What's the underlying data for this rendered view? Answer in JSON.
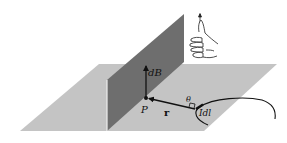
{
  "diagram": {
    "type": "biot-savart-geometry",
    "labels": {
      "field_element": "dB",
      "field_point": "P",
      "position_vector": "r",
      "angle": "θ",
      "current_element": "Idl"
    },
    "colors": {
      "horizontal_plane": "#c4c4c4",
      "vertical_plane": "#6e6e6e",
      "vertical_plane_edge": "#f0f0f0",
      "ink": "#111111"
    },
    "icons": [
      "right-hand-thumb-up-icon"
    ]
  }
}
